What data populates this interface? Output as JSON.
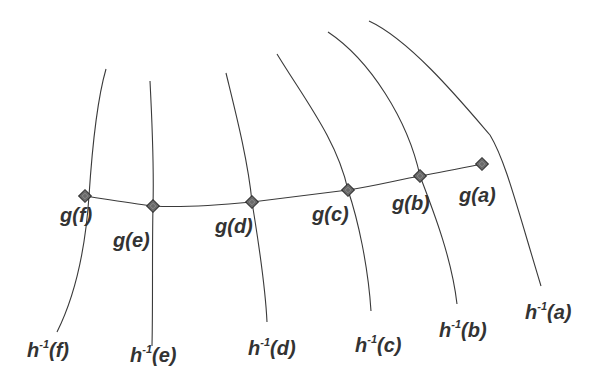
{
  "diagram": {
    "title": "",
    "colors": {
      "stroke": "#3a3a3a",
      "marker_fill": "#6a6a6a",
      "text": "#333333",
      "background": "#ffffff"
    },
    "g_points": [
      {
        "id": "f",
        "label": "g(f)",
        "x": 85,
        "y": 196,
        "label_x": 60,
        "label_y": 205
      },
      {
        "id": "e",
        "label": "g(e)",
        "x": 153,
        "y": 206,
        "label_x": 113,
        "label_y": 230
      },
      {
        "id": "d",
        "label": "g(d)",
        "x": 252,
        "y": 202,
        "label_x": 215,
        "label_y": 216
      },
      {
        "id": "c",
        "label": "g(c)",
        "x": 348,
        "y": 190,
        "label_x": 312,
        "label_y": 204
      },
      {
        "id": "b",
        "label": "g(b)",
        "x": 420,
        "y": 176,
        "label_x": 392,
        "label_y": 193
      },
      {
        "id": "a",
        "label": "g(a)",
        "x": 482,
        "y": 164,
        "label_x": 459,
        "label_y": 185
      }
    ],
    "h_inverse_curves": [
      {
        "id": "f",
        "label_base": "h",
        "label_sup": "-1",
        "label_arg": "(f)",
        "label_x": 27,
        "label_y": 340
      },
      {
        "id": "e",
        "label_base": "h",
        "label_sup": "-1",
        "label_arg": "(e)",
        "label_x": 130,
        "label_y": 345
      },
      {
        "id": "d",
        "label_base": "h",
        "label_sup": "-1",
        "label_arg": "(d)",
        "label_x": 248,
        "label_y": 338
      },
      {
        "id": "c",
        "label_base": "h",
        "label_sup": "-1",
        "label_arg": "(c)",
        "label_x": 355,
        "label_y": 335
      },
      {
        "id": "b",
        "label_base": "h",
        "label_sup": "-1",
        "label_arg": "(b)",
        "label_x": 439,
        "label_y": 320
      },
      {
        "id": "a",
        "label_base": "h",
        "label_sup": "-1",
        "label_arg": "(a)",
        "label_x": 525,
        "label_y": 302
      }
    ],
    "icons": {
      "point_marker": "diamond-marker-icon"
    }
  }
}
